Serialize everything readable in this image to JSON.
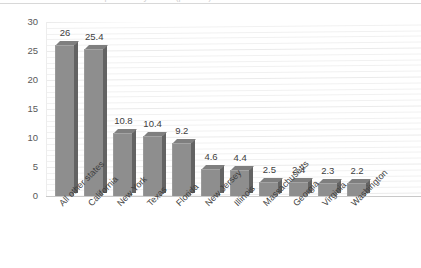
{
  "chart_data": {
    "type": "bar",
    "title": "",
    "xlabel": "",
    "ylabel": "",
    "ylim": [
      0,
      30
    ],
    "yticks": [
      0,
      5,
      10,
      15,
      20,
      25,
      30
    ],
    "grid": true,
    "legend": "none",
    "style": "3d-column",
    "categories": [
      "All other states",
      "California",
      "New York",
      "Texas",
      "Florida",
      "New Jersey",
      "Illinois",
      "Massachusetts",
      "Georgia",
      "Virginia",
      "Washington"
    ],
    "values": [
      26,
      25.4,
      10.8,
      10.4,
      9.2,
      4.6,
      4.4,
      2.5,
      2.4,
      2.3,
      2.2
    ],
    "data_labels": [
      "26",
      "25.4",
      "10.8",
      "10.4",
      "9.2",
      "4.6",
      "4.4",
      "2.5",
      "2.4",
      "2.3",
      "2.2"
    ]
  },
  "colors": {
    "bar_face": "#8e8e8e",
    "bar_side": "#636363",
    "gridline": "#f1f1f1",
    "axis_text": "#595959",
    "label_text": "#404040",
    "background": "#ffffff"
  },
  "title_remnant": "Top states by share (percent)"
}
